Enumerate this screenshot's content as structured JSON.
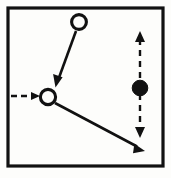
{
  "figure": {
    "canvas": {
      "width": 171,
      "height": 178
    },
    "colors": {
      "background": "#fdfdfb",
      "stroke": "#111111",
      "node_fill_open": "#fdfdfb",
      "node_fill_solid": "#111111"
    },
    "frame": {
      "label": "outer-border-rectangle",
      "x": 8,
      "y": 8,
      "width": 155,
      "height": 158,
      "stroke_width": 3.2
    },
    "nodes": [
      {
        "id": "node-top-open",
        "label": "open-circle-top",
        "style": "open",
        "cx": 79,
        "cy": 22,
        "r": 7.4
      },
      {
        "id": "node-mid-open",
        "label": "open-circle-middle-left",
        "style": "open",
        "cx": 48,
        "cy": 97,
        "r": 7.6
      },
      {
        "id": "node-right-filled",
        "label": "filled-circle-right",
        "style": "filled",
        "cx": 140,
        "cy": 88,
        "r": 7.8
      }
    ],
    "edges": [
      {
        "id": "edge-top-to-mid",
        "label": "solid-arrow-down-left",
        "style": "solid",
        "arrow": "single",
        "x1": 76,
        "y1": 31,
        "x2": 56,
        "y2": 85
      },
      {
        "id": "edge-mid-to-bottom-right",
        "label": "solid-arrow-down-right",
        "style": "solid",
        "arrow": "single",
        "x1": 55,
        "y1": 103,
        "x2": 144,
        "y2": 150
      },
      {
        "id": "edge-left-incoming",
        "label": "dashed-arrow-right",
        "style": "dashed",
        "arrow": "single",
        "x1": 11,
        "y1": 96,
        "x2": 39,
        "y2": 96,
        "dash_pattern": "6 4"
      },
      {
        "id": "edge-right-vertical",
        "label": "dashed-double-arrow-vertical",
        "style": "dashed",
        "arrow": "double",
        "x1": 140,
        "y1": 33,
        "x2": 140,
        "y2": 136,
        "dash_pattern": "6 5"
      }
    ]
  }
}
